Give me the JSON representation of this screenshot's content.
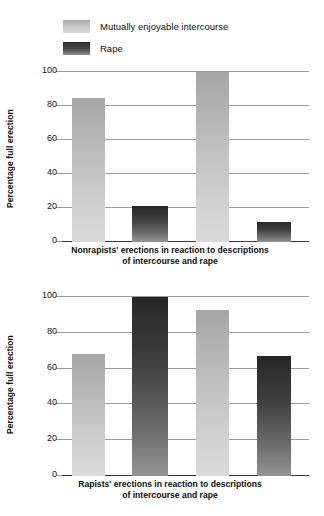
{
  "legend": {
    "items": [
      {
        "label": "Mutually enjoyable intercourse",
        "swatch": "light-gray-gradient-swatch",
        "color": "#c9c9c9"
      },
      {
        "label": "Rape",
        "swatch": "dark-gray-gradient-swatch",
        "color": "#4a4a4a"
      }
    ]
  },
  "chart_data": [
    {
      "type": "bar",
      "title": "",
      "caption_line_1": "Nonrapists' erections in reaction to descriptions",
      "caption_line_2": "of intercourse and rape",
      "xlabel": "",
      "ylabel": "Percentage full erection",
      "ylim": [
        0,
        100
      ],
      "yticks": [
        0,
        20,
        40,
        60,
        80,
        100
      ],
      "ytick_labels": [
        "0",
        "20",
        "40",
        "60",
        "80",
        "100"
      ],
      "grid": true,
      "legend_position": "above-figure",
      "categories": [
        "Intercourse A",
        "Rape A",
        "Intercourse B",
        "Rape B"
      ],
      "series": [
        {
          "name": "Mutually enjoyable intercourse",
          "color": "#c9c9c9",
          "values": [
            85,
            null,
            100,
            null
          ]
        },
        {
          "name": "Rape",
          "color": "#4a4a4a",
          "values": [
            null,
            21,
            null,
            12
          ]
        }
      ],
      "values": [
        85,
        21,
        100,
        12
      ],
      "bar_styles": [
        "light",
        "dark",
        "light",
        "dark"
      ]
    },
    {
      "type": "bar",
      "title": "",
      "caption_line_1": "Rapists' erections in reaction to descriptions",
      "caption_line_2": "of intercourse and rape",
      "xlabel": "",
      "ylabel": "Percentage full erection",
      "ylim": [
        0,
        100
      ],
      "yticks": [
        0,
        20,
        40,
        60,
        80,
        100
      ],
      "ytick_labels": [
        "0",
        "20",
        "40",
        "60",
        "80",
        "100"
      ],
      "grid": true,
      "legend_position": "above-figure",
      "categories": [
        "Intercourse A",
        "Rape A",
        "Intercourse B",
        "Rape B"
      ],
      "series": [
        {
          "name": "Mutually enjoyable intercourse",
          "color": "#c9c9c9",
          "values": [
            68,
            null,
            93,
            null
          ]
        },
        {
          "name": "Rape",
          "color": "#4a4a4a",
          "values": [
            null,
            100,
            null,
            67
          ]
        }
      ],
      "values": [
        68,
        100,
        93,
        67
      ],
      "bar_styles": [
        "light",
        "dark",
        "light",
        "dark"
      ]
    }
  ]
}
